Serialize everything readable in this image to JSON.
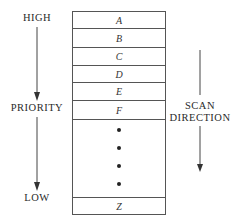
{
  "priority_axis": {
    "high_label": "HIGH",
    "middle_label": "PRIORITY",
    "low_label": "LOW"
  },
  "queue": {
    "entries": [
      "A",
      "B",
      "C",
      "D",
      "E",
      "F"
    ],
    "ellipsis_dots": 4,
    "last_entry": "Z"
  },
  "scan_axis": {
    "label_line1": "SCAN",
    "label_line2": "DIRECTION"
  }
}
